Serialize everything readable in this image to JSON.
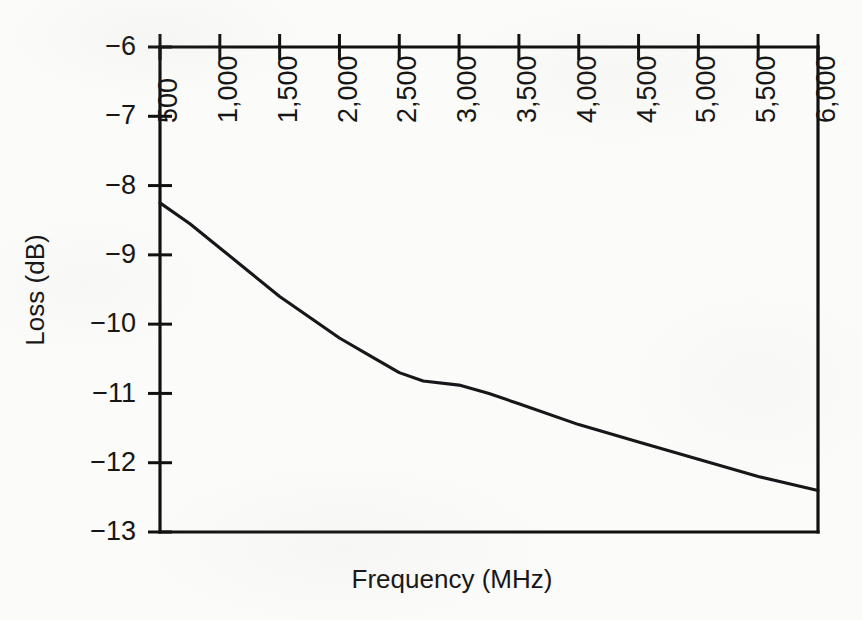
{
  "chart_data": {
    "type": "line",
    "title": "",
    "xlabel": "Frequency (MHz)",
    "ylabel": "Loss (dB)",
    "xlim": [
      500,
      6000
    ],
    "ylim": [
      -13,
      -6
    ],
    "grid": false,
    "legend": false,
    "x_axis_position": "top",
    "x_tick_rotation_deg": 90,
    "xticks": [
      500,
      1000,
      1500,
      2000,
      2500,
      3000,
      3500,
      4000,
      4500,
      5000,
      5500,
      6000
    ],
    "xtick_labels": [
      "500",
      "1,000",
      "1,500",
      "2,000",
      "2,500",
      "3,000",
      "3,500",
      "4,000",
      "4,500",
      "5,000",
      "5,500",
      "6,000"
    ],
    "yticks": [
      -6,
      -7,
      -8,
      -9,
      -10,
      -11,
      -12,
      -13
    ],
    "ytick_labels": [
      "−6",
      "−7",
      "−8",
      "−9",
      "−10",
      "−11",
      "−12",
      "−13"
    ],
    "x": [
      500,
      750,
      1000,
      1250,
      1500,
      1750,
      2000,
      2250,
      2500,
      2700,
      3000,
      3250,
      3500,
      4000,
      4500,
      5000,
      5500,
      6000
    ],
    "values": [
      -8.25,
      -8.55,
      -8.9,
      -9.25,
      -9.6,
      -9.9,
      -10.2,
      -10.45,
      -10.7,
      -10.82,
      -10.88,
      -11.0,
      -11.15,
      -11.45,
      -11.7,
      -11.95,
      -12.2,
      -12.4
    ],
    "series": [
      {
        "name": "Loss",
        "color": "#17171a",
        "x": [
          500,
          750,
          1000,
          1250,
          1500,
          1750,
          2000,
          2250,
          2500,
          2700,
          3000,
          3250,
          3500,
          4000,
          4500,
          5000,
          5500,
          6000
        ],
        "values": [
          -8.25,
          -8.55,
          -8.9,
          -9.25,
          -9.6,
          -9.9,
          -10.2,
          -10.45,
          -10.7,
          -10.82,
          -10.88,
          -11.0,
          -11.15,
          -11.45,
          -11.7,
          -11.95,
          -12.2,
          -12.4
        ]
      }
    ]
  },
  "colors": {
    "line": "#17171a",
    "axis": "#111111",
    "text": "#161616",
    "background": "#fbfbf9"
  }
}
